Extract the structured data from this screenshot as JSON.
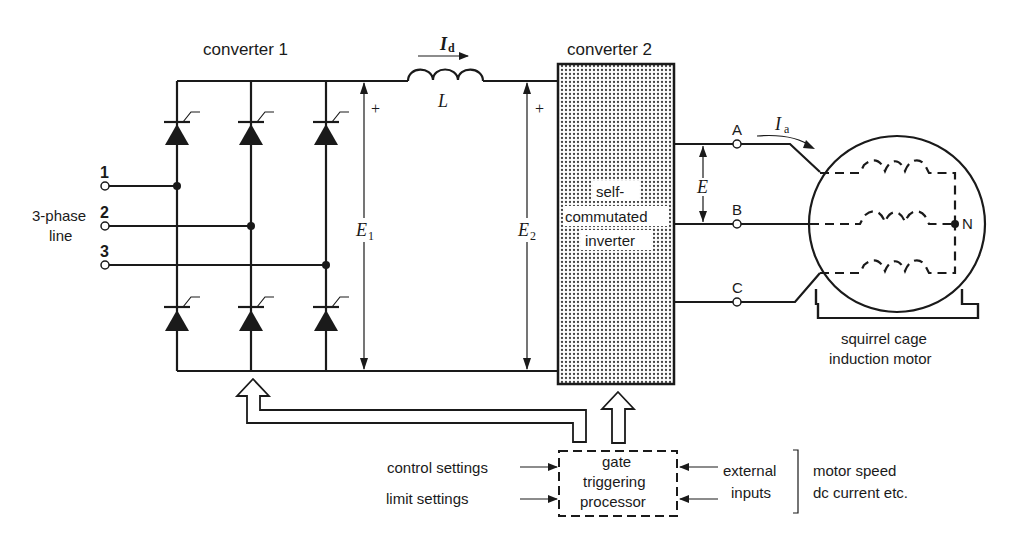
{
  "diagram": {
    "type": "circuit-schematic",
    "colors": {
      "ink": "#1a1a1a",
      "background": "#ffffff",
      "inverter_fill": "#c9c9c9"
    },
    "converter1": {
      "label": "converter 1",
      "devices": "thyristor-bridge-6",
      "voltage_label": "E",
      "voltage_sub": "1",
      "plus": "+"
    },
    "line_input": {
      "label_line1": "3-phase",
      "label_line2": "line",
      "phases": [
        "1",
        "2",
        "3"
      ]
    },
    "dc_link": {
      "current_label": "I",
      "current_sub": "d",
      "inductor_label": "L"
    },
    "converter2": {
      "label": "converter 2",
      "inner_line1": "self-",
      "inner_line2": "commutated",
      "inner_line3": "inverter",
      "voltage_label": "E",
      "voltage_sub": "2",
      "plus": "+"
    },
    "output": {
      "terminals": [
        "A",
        "B",
        "C"
      ],
      "line_voltage_label": "E",
      "current_label": "I",
      "current_sub": "a"
    },
    "motor": {
      "neutral_label": "N",
      "caption_line1": "squirrel cage",
      "caption_line2": "induction motor"
    },
    "processor": {
      "line1": "gate",
      "line2": "triggering",
      "line3": "processor",
      "inputs_left": [
        "control settings",
        "limit settings"
      ],
      "external_line1": "external",
      "external_line2": "inputs",
      "examples_line1": "motor speed",
      "examples_line2": "dc current etc."
    }
  }
}
